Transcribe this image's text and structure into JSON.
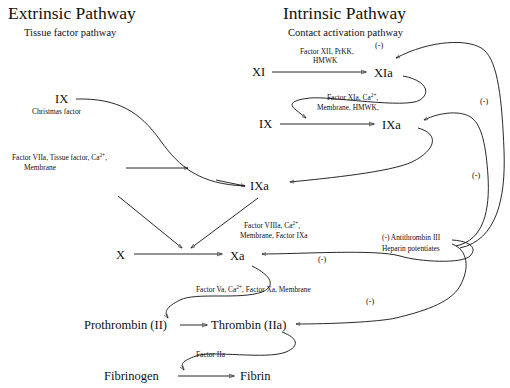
{
  "headers": {
    "extrinsic": {
      "title": "Extrinsic Pathway",
      "subtitle": "Tissue factor pathway"
    },
    "intrinsic": {
      "title": "Intrinsic Pathway",
      "subtitle": "Contact activation pathway"
    }
  },
  "nodes": {
    "xi": "XI",
    "xia": "XIa",
    "ix_intrinsic": "IX",
    "ixa_intrinsic": "IXa",
    "ix_extrinsic": "IX",
    "ix_extrinsic_sub": "Christmas factor",
    "ixa_common": "IXa",
    "x": "X",
    "xa": "Xa",
    "prothrombin": "Prothrombin (II)",
    "thrombin": "Thrombin (IIa)",
    "fibrinogen": "Fibrinogen",
    "fibrin": "Fibrin"
  },
  "cofactors": {
    "xi_to_xia_line1": "Factor XII, PrKK,",
    "xi_to_xia_line2": "HMWK",
    "ix_to_ixa_line1": "Factor XIa, Ca",
    "ix_to_ixa_line1_sup": "2+",
    "ix_to_ixa_line1_tail": ",",
    "ix_to_ixa_line2": "Membrane,  HMWK,",
    "extrinsic_line1": "Factor VIIa, Tissue factor, Ca",
    "extrinsic_line1_sup": "2+",
    "extrinsic_line1_tail": ",",
    "extrinsic_line2": "Membrane",
    "x_to_xa_line1": "Factor VIIIa, Ca",
    "x_to_xa_line1_sup": "2+",
    "x_to_xa_line1_tail": ",",
    "x_to_xa_line2": "Membrane, Factor IXa",
    "prothrombin_line1": "Factor Va, Ca",
    "prothrombin_line1_sup": "2+",
    "prothrombin_line1_tail": ", Factor Xa, Membrane",
    "fibrinogen_line1": "Factor IIa"
  },
  "inhibition": {
    "antithrombin_line1": "(-) Antithrombin III",
    "antithrombin_line2": "Heparin potentiates",
    "minus_xia": "(-)",
    "minus_ixa": "(-)",
    "minus_xa": "(-)",
    "minus_thrombin": "(-)"
  },
  "colors": {
    "background": "#ffffff",
    "stroke": "#111111",
    "text": "#111111"
  }
}
